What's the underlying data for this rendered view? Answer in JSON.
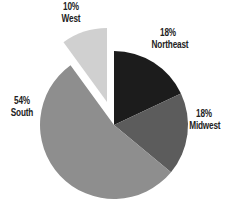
{
  "chart_data": {
    "type": "pie",
    "title": "",
    "start_angle_deg": 0,
    "direction": "clockwise",
    "center": [
      114,
      125
    ],
    "radius": 74,
    "slices": [
      {
        "label": "Northeast",
        "value": 18,
        "pct_label": "18%",
        "color": "#1c1c1c",
        "exploded": false,
        "explode_offset": [
          0,
          0
        ],
        "label_pos": [
          167,
          33
        ]
      },
      {
        "label": "Midwest",
        "value": 18,
        "pct_label": "18%",
        "color": "#5c5c5c",
        "exploded": false,
        "explode_offset": [
          0,
          0
        ],
        "label_pos": [
          203,
          113
        ]
      },
      {
        "label": "South",
        "value": 54,
        "pct_label": "54%",
        "color": "#8e8e8e",
        "exploded": false,
        "explode_offset": [
          0,
          0
        ],
        "label_pos": [
          22,
          101
        ]
      },
      {
        "label": "West",
        "value": 10,
        "pct_label": "10%",
        "color": "#d0d0d0",
        "exploded": true,
        "explode_offset": [
          -7,
          -23
        ],
        "label_pos": [
          70,
          5
        ]
      }
    ],
    "legend": null
  },
  "labels": {
    "northeast": {
      "pct": "18%",
      "name": "Northeast"
    },
    "midwest": {
      "pct": "18%",
      "name": "Midwest"
    },
    "south": {
      "pct": "54%",
      "name": "South"
    },
    "west": {
      "pct": "10%",
      "name": "West"
    }
  }
}
